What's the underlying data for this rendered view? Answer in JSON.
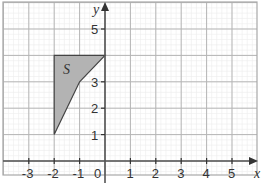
{
  "diagram": {
    "type": "coordinate-grid",
    "axes": {
      "x_label": "x",
      "y_label": "y",
      "x_range": [
        -4,
        6
      ],
      "y_range": [
        -1,
        6
      ],
      "origin_label": "0",
      "x_ticks": [
        -3,
        -2,
        -1,
        1,
        2,
        3,
        4,
        5
      ],
      "y_ticks": [
        1,
        2,
        3,
        5
      ]
    },
    "grid": {
      "minor_subdivisions": 5,
      "major_color": "#b5b5b5",
      "minor_color": "#ececec",
      "axis_color": "#555555"
    },
    "shapes": [
      {
        "label": "S",
        "vertices": [
          [
            -2,
            4
          ],
          [
            0,
            4
          ],
          [
            -1,
            3
          ],
          [
            -2,
            1
          ]
        ],
        "fill": "#b3b3b3",
        "stroke": "#444444",
        "label_position": [
          -1.5,
          3.5
        ]
      }
    ]
  }
}
